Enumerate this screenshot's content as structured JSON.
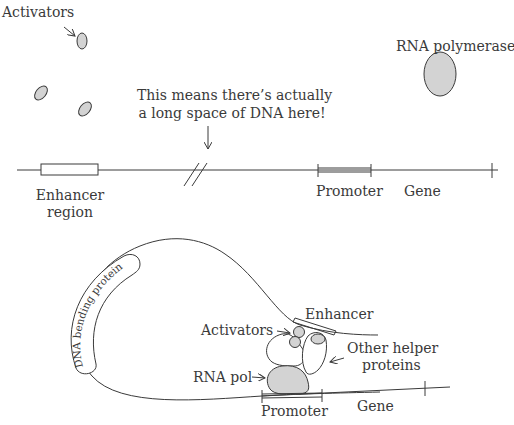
{
  "top_panel": {
    "activators_label": "Activators",
    "rna_polymerase_label": "RNA polymerase",
    "annotation_line1": "This means there’s actually",
    "annotation_line2": "a long space of DNA here!",
    "enhancer_line1": "Enhancer",
    "enhancer_line2": "region",
    "promoter_label": "Promoter",
    "gene_label": "Gene"
  },
  "bottom_panel": {
    "dna_bending_protein_label": "DNA bending protein",
    "enhancer_label": "Enhancer",
    "activators_label": "Activators",
    "other_helper_line1": "Other helper",
    "other_helper_line2": "proteins",
    "rna_pol_label": "RNA pol",
    "promoter_label": "Promoter",
    "gene_label": "Gene"
  },
  "colors": {
    "line": "#3a3a3a",
    "protein_fill": "#d3d3d3",
    "background": "#ffffff"
  }
}
